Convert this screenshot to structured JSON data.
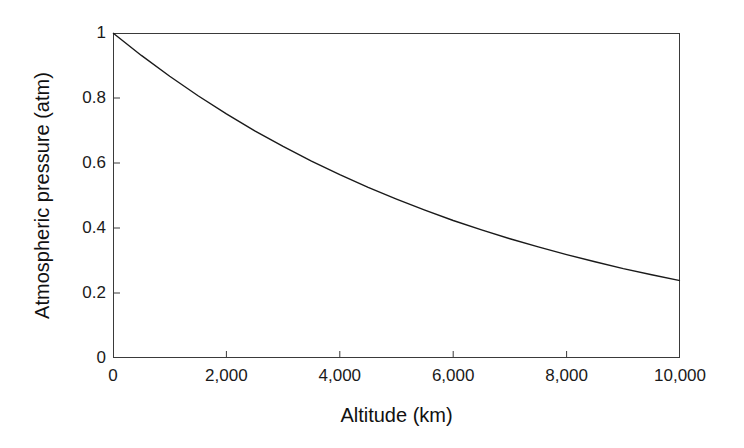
{
  "chart_data": {
    "type": "line",
    "title": "",
    "xlabel": "Altitude (km)",
    "ylabel": "Atmospheric pressure (atm)",
    "xlim": [
      0,
      10000
    ],
    "ylim": [
      0,
      1
    ],
    "xticks": [
      0,
      2000,
      4000,
      6000,
      8000,
      10000
    ],
    "xtick_labels": [
      "0",
      "2,000",
      "4,000",
      "6,000",
      "8,000",
      "10,000"
    ],
    "yticks": [
      0,
      0.2,
      0.4,
      0.6,
      0.8,
      1
    ],
    "ytick_labels": [
      "0",
      "0.2",
      "0.4",
      "0.6",
      "0.8",
      "1"
    ],
    "grid": false,
    "legend": null,
    "line_color": "#1a1a1a",
    "frame_color": "#3a3a3a",
    "background_color": "#ffffff",
    "series": [
      {
        "name": "Atmospheric pressure",
        "x": [
          0,
          500,
          1000,
          1500,
          2000,
          2500,
          3000,
          3500,
          4000,
          4500,
          5000,
          5500,
          6000,
          6500,
          7000,
          7500,
          8000,
          8500,
          9000,
          9500,
          10000
        ],
        "values": [
          1.0,
          0.931,
          0.867,
          0.807,
          0.751,
          0.699,
          0.651,
          0.606,
          0.564,
          0.525,
          0.489,
          0.455,
          0.423,
          0.394,
          0.367,
          0.342,
          0.318,
          0.296,
          0.275,
          0.256,
          0.238
        ]
      }
    ]
  }
}
